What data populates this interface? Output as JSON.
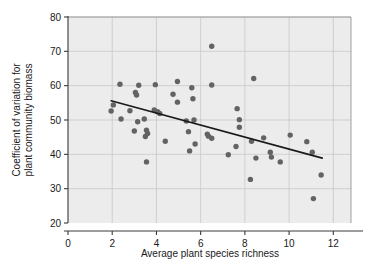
{
  "chart_data": {
    "type": "scatter",
    "title": "",
    "xlabel": "Average plant species richness",
    "ylabel": "Coefficient of variation for plant community biomass",
    "ylabel_lines": [
      "Coefficient of variation for",
      "plant community biomass"
    ],
    "xlim": [
      0,
      12.8
    ],
    "ylim": [
      20,
      80
    ],
    "xticks": [
      0,
      2,
      4,
      6,
      8,
      10,
      12
    ],
    "xtick_labels": [
      "0",
      "2",
      "4",
      "6",
      "8",
      "10",
      "12"
    ],
    "yticks": [
      20,
      30,
      40,
      50,
      60,
      70,
      80
    ],
    "ytick_labels": [
      "20",
      "30",
      "40",
      "50",
      "60",
      "70",
      "80"
    ],
    "grid": true,
    "grid_color": "#c8c8c8",
    "plot_background": "#ececec",
    "point_color": "#636363",
    "point_radius": 2.7,
    "legend": null,
    "legend_position": "none",
    "points": [
      {
        "x": 1.95,
        "y": 52.6
      },
      {
        "x": 2.05,
        "y": 54.4
      },
      {
        "x": 2.35,
        "y": 60.4
      },
      {
        "x": 2.4,
        "y": 50.3
      },
      {
        "x": 2.8,
        "y": 52.7
      },
      {
        "x": 3.05,
        "y": 58.0
      },
      {
        "x": 3.1,
        "y": 57.3
      },
      {
        "x": 3.15,
        "y": 49.5
      },
      {
        "x": 3.2,
        "y": 60.1
      },
      {
        "x": 3.0,
        "y": 46.8
      },
      {
        "x": 3.45,
        "y": 50.3
      },
      {
        "x": 3.5,
        "y": 45.2
      },
      {
        "x": 3.55,
        "y": 47.0
      },
      {
        "x": 3.6,
        "y": 46.1
      },
      {
        "x": 3.55,
        "y": 37.8
      },
      {
        "x": 3.95,
        "y": 60.3
      },
      {
        "x": 3.9,
        "y": 52.9
      },
      {
        "x": 4.05,
        "y": 52.4
      },
      {
        "x": 4.15,
        "y": 51.9
      },
      {
        "x": 4.4,
        "y": 43.8
      },
      {
        "x": 4.75,
        "y": 57.5
      },
      {
        "x": 4.95,
        "y": 61.2
      },
      {
        "x": 4.95,
        "y": 55.2
      },
      {
        "x": 5.35,
        "y": 49.7
      },
      {
        "x": 5.45,
        "y": 46.6
      },
      {
        "x": 5.5,
        "y": 41.0
      },
      {
        "x": 5.6,
        "y": 59.4
      },
      {
        "x": 5.65,
        "y": 56.2
      },
      {
        "x": 5.7,
        "y": 50.0
      },
      {
        "x": 5.75,
        "y": 43.0
      },
      {
        "x": 6.3,
        "y": 45.9
      },
      {
        "x": 6.35,
        "y": 45.3
      },
      {
        "x": 6.5,
        "y": 71.5
      },
      {
        "x": 6.5,
        "y": 60.2
      },
      {
        "x": 6.5,
        "y": 44.7
      },
      {
        "x": 7.25,
        "y": 39.9
      },
      {
        "x": 7.6,
        "y": 42.3
      },
      {
        "x": 7.65,
        "y": 53.3
      },
      {
        "x": 7.75,
        "y": 50.1
      },
      {
        "x": 7.75,
        "y": 47.9
      },
      {
        "x": 8.25,
        "y": 32.7
      },
      {
        "x": 8.3,
        "y": 43.8
      },
      {
        "x": 8.4,
        "y": 62.1
      },
      {
        "x": 8.5,
        "y": 38.9
      },
      {
        "x": 8.85,
        "y": 44.8
      },
      {
        "x": 9.15,
        "y": 40.6
      },
      {
        "x": 9.2,
        "y": 39.2
      },
      {
        "x": 9.6,
        "y": 37.8
      },
      {
        "x": 10.05,
        "y": 45.6
      },
      {
        "x": 10.8,
        "y": 43.7
      },
      {
        "x": 11.05,
        "y": 40.6
      },
      {
        "x": 11.1,
        "y": 27.1
      },
      {
        "x": 11.45,
        "y": 34.0
      }
    ],
    "trendline": {
      "x_start": 1.95,
      "y_start": 55.6,
      "x_end": 11.5,
      "y_end": 38.9,
      "color": "#1a1a1a",
      "width": 1.6
    }
  }
}
